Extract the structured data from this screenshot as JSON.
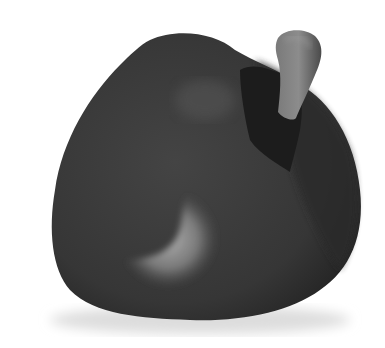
{
  "image": {
    "subject": "bell pepper",
    "description": "Grayscale photograph of a bell pepper with a short stem on a white background",
    "colors": {
      "background": "#ffffff",
      "body": "#3a3a3a",
      "body_dark": "#262626",
      "highlight": "#a8a8a8",
      "stem": "#6e6e6e",
      "stem_light": "#8a8a8a",
      "shadow": "#1c1c1c"
    }
  }
}
